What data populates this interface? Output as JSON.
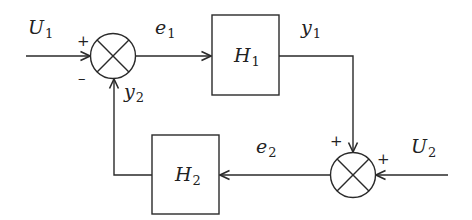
{
  "diagram": {
    "type": "block-diagram",
    "signals": {
      "U1": {
        "base": "U",
        "sub": "1"
      },
      "U2": {
        "base": "U",
        "sub": "2"
      },
      "e1": {
        "base": "e",
        "sub": "1"
      },
      "e2": {
        "base": "e",
        "sub": "2"
      },
      "y1": {
        "base": "y",
        "sub": "1"
      },
      "y2": {
        "base": "y",
        "sub": "2"
      }
    },
    "blocks": {
      "H1": {
        "base": "H",
        "sub": "1"
      },
      "H2": {
        "base": "H",
        "sub": "2"
      }
    },
    "junctions": {
      "sum1": {
        "signs": {
          "U1": "+",
          "y2": "–"
        }
      },
      "sum2": {
        "signs": {
          "y1": "+",
          "U2": "+"
        }
      }
    },
    "connections": [
      {
        "from": "U1",
        "to": "sum1",
        "sign": "+"
      },
      {
        "from": "sum1",
        "to": "H1",
        "label": "e1"
      },
      {
        "from": "H1",
        "to": "sum2",
        "label": "y1",
        "sign": "+"
      },
      {
        "from": "U2",
        "to": "sum2",
        "sign": "+"
      },
      {
        "from": "sum2",
        "to": "H2",
        "label": "e2"
      },
      {
        "from": "H2",
        "to": "sum1",
        "label": "y2",
        "sign": "–"
      }
    ],
    "colors": {
      "stroke": "#2a2a2a",
      "background": "#ffffff"
    }
  }
}
